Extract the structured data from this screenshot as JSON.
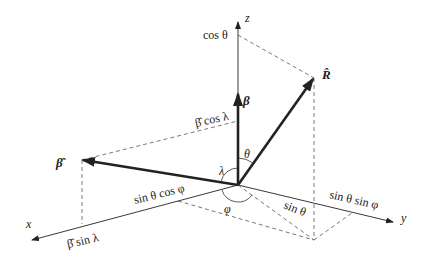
{
  "diagram": {
    "type": "3d-coordinate-vector-diagram",
    "colors": {
      "line": "#222222",
      "dashed": "#555555",
      "background": "#ffffff"
    },
    "axes": {
      "x": {
        "label": "x"
      },
      "y": {
        "label": "y"
      },
      "z": {
        "label": "z"
      }
    },
    "vectors": {
      "beta": {
        "label": "β"
      },
      "beta_hat": {
        "label": "β̂"
      },
      "r_hat": {
        "label": "R̂"
      }
    },
    "angles": {
      "theta": "θ",
      "lambda": "λ",
      "phi": "φ"
    },
    "projections": {
      "cos_theta": "cos θ",
      "beta_cos_lambda": "β̂ cos λ",
      "beta_sin_lambda": "β̂ sin λ",
      "sin_theta": "sin θ",
      "sin_theta_cos_phi": "sin θ cos φ",
      "sin_theta_sin_phi": "sin θ sin φ"
    }
  }
}
